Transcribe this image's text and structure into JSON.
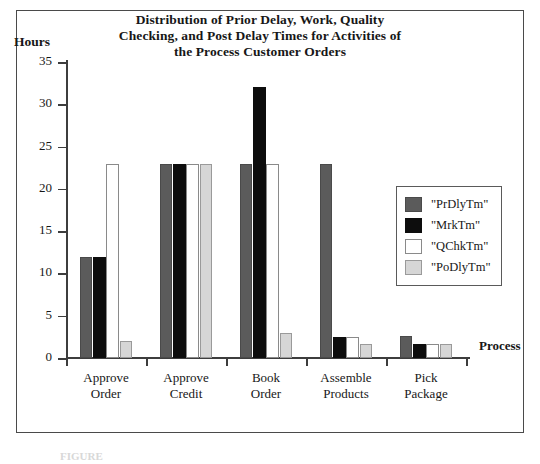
{
  "figure": {
    "caption_fragment": "FIGURE"
  },
  "chart_data": {
    "type": "bar",
    "title_lines": [
      "Distribution of Prior Delay, Work, Quality",
      "Checking, and Post Delay Times for Activities of",
      "the Process Customer Orders"
    ],
    "xlabel": "Process",
    "ylabel": "Hours",
    "ylim": [
      0,
      35
    ],
    "yticks": [
      0,
      5,
      10,
      15,
      20,
      25,
      30,
      35
    ],
    "ytick_labels": [
      "0",
      "5",
      "10",
      "15",
      "20",
      "25",
      "30",
      "35"
    ],
    "grid": false,
    "legend_position": "right-inside",
    "categories": [
      "Approve Order",
      "Approve Credit",
      "Book Order",
      "Assemble Products",
      "Pick Package"
    ],
    "category_lines": [
      [
        "Approve",
        "Order"
      ],
      [
        "Approve",
        "Credit"
      ],
      [
        "Book",
        "Order"
      ],
      [
        "Assemble",
        "Products"
      ],
      [
        "Pick",
        "Package"
      ]
    ],
    "series": [
      {
        "name": "\"PrDlyTm\"",
        "color": "#5b5b5b",
        "values": [
          12,
          23,
          23,
          23,
          2.6
        ]
      },
      {
        "name": "\"MrkTm\"",
        "color": "#0d0d0d",
        "values": [
          12,
          23,
          32,
          2.5,
          1.6
        ]
      },
      {
        "name": "\"QChkTm\"",
        "color": "#ffffff",
        "values": [
          23,
          23,
          23,
          2.5,
          1.6
        ]
      },
      {
        "name": "\"PoDlyTm\"",
        "color": "#d6d6d6",
        "values": [
          2,
          23,
          2.9,
          1.7,
          1.6
        ]
      }
    ]
  }
}
